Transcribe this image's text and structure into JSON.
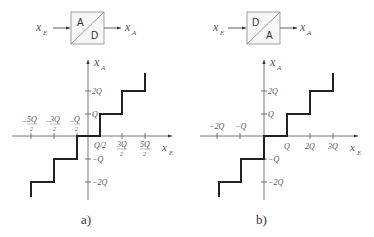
{
  "diagram_a": {
    "caption": "a)",
    "converter": {
      "top_label": "A",
      "bottom_label": "D",
      "input": "x",
      "input_sub": "E",
      "output": "x",
      "output_sub": "A"
    },
    "y_axis_label": "x",
    "y_axis_sub": "A",
    "x_axis_label": "x",
    "x_axis_sub": "E",
    "x_ticks_negative": [
      {
        "num": "5Q",
        "den": "2",
        "sign": "−"
      },
      {
        "num": "3Q",
        "den": "2",
        "sign": "−"
      },
      {
        "num": "Q",
        "den": "2",
        "sign": "−"
      }
    ],
    "x_ticks_positive": [
      {
        "label": "Q/2"
      },
      {
        "num": "3Q",
        "den": "2"
      },
      {
        "num": "5Q",
        "den": "2"
      }
    ],
    "y_ticks": {
      "q": "Q",
      "two_q": "2Q",
      "neg_q": "−Q",
      "neg_two_q": "−2Q"
    }
  },
  "diagram_b": {
    "caption": "b)",
    "converter": {
      "top_label": "D",
      "bottom_label": "A",
      "input": "x",
      "input_sub": "E",
      "output": "x",
      "output_sub": "A"
    },
    "y_axis_label": "x",
    "y_axis_sub": "A",
    "x_axis_label": "x",
    "x_axis_sub": "E",
    "x_ticks": {
      "neg_two_q": "−2Q",
      "neg_q": "−Q",
      "q": "Q",
      "two_q": "2Q",
      "three_q": "3Q"
    },
    "y_ticks": {
      "q": "Q",
      "two_q": "2Q",
      "neg_q": "−Q",
      "neg_two_q": "−2Q"
    }
  }
}
